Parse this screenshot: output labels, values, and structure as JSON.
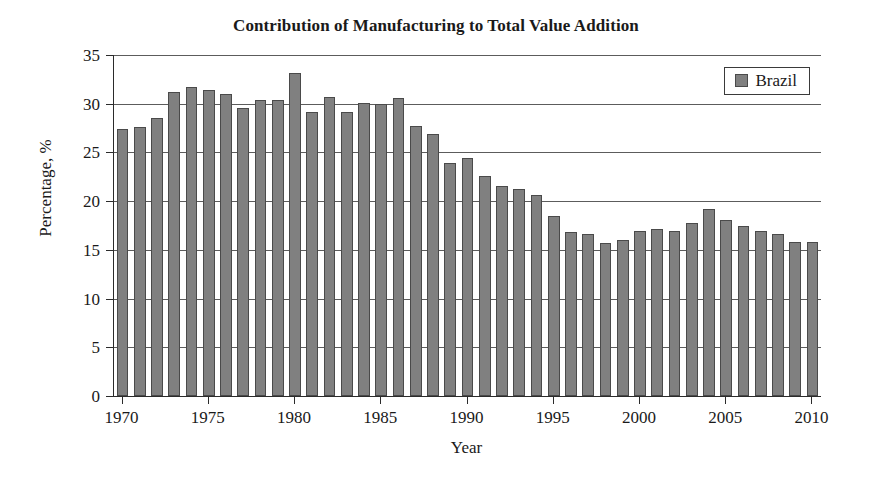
{
  "chart_data": {
    "type": "bar",
    "title": "Contribution of Manufacturing to Total Value Addition",
    "xlabel": "Year",
    "ylabel": "Percentage, %",
    "ylim": [
      0,
      35
    ],
    "ytick_step": 5,
    "yticks": [
      0,
      5,
      10,
      15,
      20,
      25,
      30,
      35
    ],
    "xlim": [
      1970,
      2010
    ],
    "xticks": [
      1970,
      1975,
      1980,
      1985,
      1990,
      1995,
      2000,
      2005,
      2010
    ],
    "grid": true,
    "legend_position": "top-right",
    "legend": [
      "Brazil"
    ],
    "series_name": "Brazil",
    "bar_color": "#808080",
    "bar_edge_color": "#4a4a4a",
    "categories": [
      1970,
      1971,
      1972,
      1973,
      1974,
      1975,
      1976,
      1977,
      1978,
      1979,
      1980,
      1981,
      1982,
      1983,
      1984,
      1985,
      1986,
      1987,
      1988,
      1989,
      1990,
      1991,
      1992,
      1993,
      1994,
      1995,
      1996,
      1997,
      1998,
      1999,
      2000,
      2001,
      2002,
      2003,
      2004,
      2005,
      2006,
      2007,
      2008,
      2009,
      2010
    ],
    "values": [
      27.4,
      27.6,
      28.5,
      31.2,
      31.7,
      31.4,
      31.0,
      29.6,
      30.4,
      30.4,
      33.2,
      29.2,
      30.7,
      29.1,
      30.1,
      30.0,
      30.6,
      27.7,
      26.9,
      23.9,
      24.4,
      22.6,
      21.6,
      21.2,
      20.6,
      18.5,
      16.8,
      16.6,
      15.7,
      16.0,
      16.9,
      17.1,
      16.9,
      17.8,
      19.2,
      18.1,
      17.4,
      16.9,
      16.6,
      15.8,
      15.8
    ]
  }
}
